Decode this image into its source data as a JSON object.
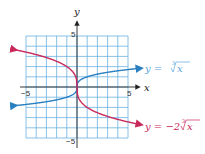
{
  "chart_data": {
    "type": "line",
    "title": "",
    "xlabel": "x",
    "ylabel": "y",
    "xlim": [
      -5,
      5
    ],
    "ylim": [
      -5,
      5
    ],
    "grid": true,
    "grid_step": 1,
    "x_tick_labels": [
      "-5",
      "5"
    ],
    "y_tick_labels": [
      "5",
      "-5"
    ],
    "series": [
      {
        "name": "y = ∛x",
        "function": "cbrt(x)",
        "color": "#2a7fc1",
        "x": [
          -6,
          -5,
          -4,
          -3,
          -2,
          -1,
          -0.5,
          -0.1,
          0,
          0.1,
          0.5,
          1,
          2,
          3,
          4,
          5,
          6
        ],
        "y": [
          -1.82,
          -1.71,
          -1.59,
          -1.44,
          -1.26,
          -1,
          -0.79,
          -0.46,
          0,
          0.46,
          0.79,
          1,
          1.26,
          1.44,
          1.59,
          1.71,
          1.82
        ]
      },
      {
        "name": "y = −2∛x",
        "function": "-2*cbrt(x)",
        "color": "#c8285a",
        "x": [
          -6,
          -5,
          -4,
          -3,
          -2,
          -1,
          -0.5,
          -0.1,
          0,
          0.1,
          0.5,
          1,
          2,
          3,
          4,
          5,
          6
        ],
        "y": [
          3.63,
          3.42,
          3.17,
          2.88,
          2.52,
          2,
          1.59,
          0.93,
          0,
          -0.93,
          -1.59,
          -2,
          -2.52,
          -2.88,
          -3.17,
          -3.42,
          -3.63
        ]
      }
    ],
    "annotations": [
      {
        "text_prefix": "y = ",
        "radical_index": "3",
        "radicand": "x",
        "coefficient": "",
        "series": 0
      },
      {
        "text_prefix": "y = −2",
        "radical_index": "3",
        "radicand": "x",
        "coefficient": "−2",
        "series": 1
      }
    ]
  },
  "labels": {
    "x_axis": "x",
    "y_axis": "y",
    "x_min": "−5",
    "x_max": "5",
    "y_max": "5",
    "y_min": "−5",
    "blue_eq_prefix": "y = ",
    "blue_eq_index": "3",
    "blue_eq_radicand": "x",
    "red_eq_prefix": "y = −2",
    "red_eq_index": "3",
    "red_eq_radicand": "x"
  },
  "colors": {
    "grid": "#6bb3e0",
    "blue_curve": "#2a7fc1",
    "red_curve": "#c8285a",
    "axis": "#222222"
  }
}
